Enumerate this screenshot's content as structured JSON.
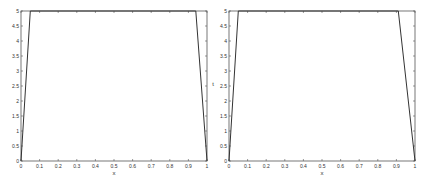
{
  "colors": {
    "axis": "#555555",
    "line": "#333333",
    "background": "#ffffff"
  },
  "chart_data": [
    {
      "type": "line",
      "title": "",
      "xlabel": "x",
      "ylabel": "",
      "xlim": [
        0,
        1
      ],
      "ylim": [
        0,
        5
      ],
      "grid": false,
      "xticks": [
        "0",
        "0.1",
        "0.2",
        "0.3",
        "0.4",
        "0.5",
        "0.6",
        "0.7",
        "0.8",
        "0.9",
        "1"
      ],
      "yticks": [
        "0",
        "0.5",
        "1",
        "1.5",
        "2",
        "2.5",
        "3",
        "3.5",
        "4",
        "4.5",
        "5"
      ],
      "series": [
        {
          "name": "",
          "x": [
            0,
            0.05,
            0.94,
            1
          ],
          "y": [
            0,
            5,
            5,
            0
          ]
        }
      ]
    },
    {
      "type": "line",
      "title": "",
      "xlabel": "x",
      "ylabel": "t",
      "xlim": [
        0,
        1
      ],
      "ylim": [
        0,
        5
      ],
      "grid": false,
      "xticks": [
        "0",
        "0.1",
        "0.2",
        "0.3",
        "0.4",
        "0.5",
        "0.6",
        "0.7",
        "0.8",
        "0.9",
        "1"
      ],
      "yticks": [
        "0",
        "0.5",
        "1",
        "1.5",
        "2",
        "2.5",
        "3",
        "3.5",
        "4",
        "4.5",
        "5"
      ],
      "series": [
        {
          "name": "",
          "x": [
            0,
            0.05,
            0.91,
            1
          ],
          "y": [
            0,
            5,
            5,
            0
          ]
        }
      ]
    }
  ]
}
